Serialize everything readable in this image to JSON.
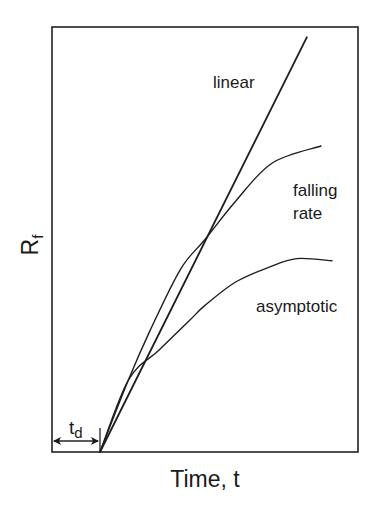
{
  "chart_data": {
    "type": "line",
    "title": "",
    "xlabel": "Time, t",
    "ylabel": "R",
    "ylabel_subscript": "f",
    "xlim": [
      0,
      10
    ],
    "ylim": [
      0,
      10
    ],
    "grid": false,
    "ticks": false,
    "legend": "inline annotations",
    "delay": {
      "label": "t",
      "label_subscript": "d",
      "value": 1.57,
      "annotation": "double-headed arrow from t=0 to t=t_d"
    },
    "series": [
      {
        "name": "linear",
        "label_pos": [
          5.25,
          8.5
        ],
        "points": [
          [
            1.57,
            0.0
          ],
          [
            8.33,
            9.76
          ]
        ]
      },
      {
        "name": "falling rate",
        "label_lines": [
          "falling",
          "rate"
        ],
        "label_pos": [
          7.9,
          6.0
        ],
        "points": [
          [
            1.57,
            0.0
          ],
          [
            2.5,
            1.7
          ],
          [
            3.2,
            2.85
          ],
          [
            4.2,
            4.3
          ],
          [
            5.0,
            5.0
          ],
          [
            6.0,
            5.9
          ],
          [
            7.2,
            6.8
          ],
          [
            8.79,
            7.2
          ]
        ]
      },
      {
        "name": "asymptotic",
        "label_pos": [
          6.7,
          3.3
        ],
        "points": [
          [
            1.57,
            0.0
          ],
          [
            2.5,
            1.7
          ],
          [
            3.5,
            2.4
          ],
          [
            4.5,
            3.1
          ],
          [
            5.0,
            3.45
          ],
          [
            6.0,
            4.0
          ],
          [
            7.1,
            4.35
          ],
          [
            8.0,
            4.55
          ],
          [
            9.15,
            4.5
          ]
        ]
      }
    ]
  }
}
